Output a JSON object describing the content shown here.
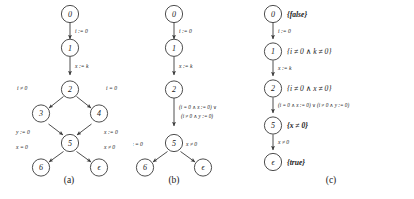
{
  "figure": {
    "panels": [
      {
        "id": "panel-a",
        "caption": "(a)",
        "nodes": [
          {
            "id": "n0",
            "label": "0"
          },
          {
            "id": "n1",
            "label": "1"
          },
          {
            "id": "n2",
            "label": "2"
          },
          {
            "id": "n3",
            "label": "3"
          },
          {
            "id": "n4",
            "label": "4"
          },
          {
            "id": "n5",
            "label": "5"
          },
          {
            "id": "n6",
            "label": "6"
          },
          {
            "id": "neps",
            "label": "ϵ"
          }
        ],
        "edges": [
          {
            "from": "0",
            "to": "1",
            "label": "i := 0"
          },
          {
            "from": "1",
            "to": "2",
            "label": "x := k"
          },
          {
            "from": "2",
            "to": "3",
            "label": "i ≠ 0"
          },
          {
            "from": "2",
            "to": "4",
            "label": "i = 0"
          },
          {
            "from": "3",
            "to": "5",
            "label": "y := 0"
          },
          {
            "from": "4",
            "to": "5",
            "label": "x := 0"
          },
          {
            "from": "5",
            "to": "6",
            "label": "x = 0"
          },
          {
            "from": "5",
            "to": "ϵ",
            "label": "x ≠ 0"
          }
        ]
      },
      {
        "id": "panel-b",
        "caption": "(b)",
        "nodes": [
          {
            "id": "n0",
            "label": "0"
          },
          {
            "id": "n1",
            "label": "1"
          },
          {
            "id": "n2",
            "label": "2"
          },
          {
            "id": "n5",
            "label": "5"
          },
          {
            "id": "n6",
            "label": "6"
          },
          {
            "id": "neps",
            "label": "ϵ"
          }
        ],
        "edges": [
          {
            "from": "0",
            "to": "1",
            "label": "i := 0"
          },
          {
            "from": "1",
            "to": "2",
            "label": "x := k"
          },
          {
            "from": "2",
            "to": "5",
            "label_line1": "(i = 0 ∧ x := 0) ∨",
            "label_line2": "(i ≠ 0 ∧ y := 0)"
          },
          {
            "from": "5",
            "to": "6",
            "label": "x = 0"
          },
          {
            "from": "5",
            "to": "ϵ",
            "label": "x ≠ 0"
          }
        ]
      },
      {
        "id": "panel-c",
        "caption": "(c)",
        "nodes": [
          {
            "id": "n0",
            "label": "0",
            "assertion": "{false}"
          },
          {
            "id": "n1",
            "label": "1",
            "assertion": "{i ≠ 0 ∧ k ≠ 0}"
          },
          {
            "id": "n2",
            "label": "2",
            "assertion": "{i ≠ 0 ∧ x ≠ 0}"
          },
          {
            "id": "n5",
            "label": "5",
            "assertion": "{x ≠ 0}"
          },
          {
            "id": "neps",
            "label": "ϵ",
            "assertion": "{true}"
          }
        ],
        "edges": [
          {
            "from": "0",
            "to": "1",
            "label": "i := 0"
          },
          {
            "from": "1",
            "to": "2",
            "label": "x := k"
          },
          {
            "from": "2",
            "to": "5",
            "label": "(i = 0 ∧ x := 0) ∨ (i ≠ 0 ∧ y := 0)"
          },
          {
            "from": "5",
            "to": "ϵ",
            "label": "x ≠ 0"
          }
        ]
      }
    ]
  }
}
